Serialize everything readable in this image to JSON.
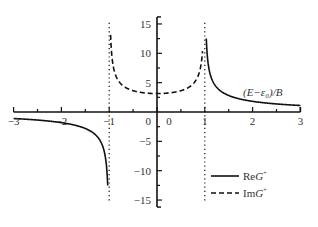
{
  "chart_data": {
    "type": "line",
    "title": "",
    "xlabel": "(E−ε₀)/B",
    "ylabel": "",
    "xlim": [
      -3,
      3
    ],
    "ylim": [
      -17,
      17
    ],
    "x_ticks": [
      -3,
      -2,
      -1,
      0,
      1,
      2,
      3
    ],
    "x_tick_labels": [
      "−3",
      "−2",
      "−1",
      "0",
      "1",
      "2",
      "3"
    ],
    "y_ticks": [
      -15,
      -10,
      -5,
      0,
      5,
      10,
      15
    ],
    "y_tick_labels": [
      "−15",
      "−10",
      "−5",
      "0",
      "5",
      "10",
      "15"
    ],
    "grid": false,
    "legend_position": "lower right",
    "vertical_guides": [
      -1,
      1
    ],
    "series": [
      {
        "name": "ReG⁺",
        "style": "solid",
        "formula": "π·sign(x)/sqrt(x²−1) for |x|>1, 0 otherwise",
        "points_left": [
          [
            -3,
            -1.11
          ],
          [
            -2.5,
            -1.37
          ],
          [
            -2,
            -1.81
          ],
          [
            -1.5,
            -2.81
          ],
          [
            -1.2,
            -4.74
          ],
          [
            -1.1,
            -6.85
          ],
          [
            -1.05,
            -9.81
          ],
          [
            -1.03,
            -12.6
          ]
        ],
        "points_right": [
          [
            1.03,
            12.6
          ],
          [
            1.05,
            9.81
          ],
          [
            1.1,
            6.85
          ],
          [
            1.2,
            4.74
          ],
          [
            1.5,
            2.81
          ],
          [
            2,
            1.81
          ],
          [
            2.5,
            1.37
          ],
          [
            3,
            1.11
          ]
        ]
      },
      {
        "name": "ImG⁺",
        "style": "dashed",
        "formula": "π/sqrt(1−x²) for |x|<1",
        "points": [
          [
            -0.97,
            12.9
          ],
          [
            -0.95,
            10.06
          ],
          [
            -0.9,
            7.21
          ],
          [
            -0.8,
            5.24
          ],
          [
            -0.6,
            3.93
          ],
          [
            -0.4,
            3.43
          ],
          [
            -0.2,
            3.21
          ],
          [
            0,
            3.14
          ],
          [
            0.2,
            3.21
          ],
          [
            0.4,
            3.43
          ],
          [
            0.6,
            3.93
          ],
          [
            0.8,
            5.24
          ],
          [
            0.9,
            7.21
          ],
          [
            0.95,
            10.06
          ]
        ]
      }
    ]
  },
  "legend": {
    "items": [
      {
        "label_prefix": "Re",
        "label_var": "G",
        "label_sup": "+",
        "style": "solid"
      },
      {
        "label_prefix": "Im",
        "label_var": "G",
        "label_sup": "+",
        "style": "dashed"
      }
    ]
  },
  "axis_title": "(E−ε₀)/B"
}
